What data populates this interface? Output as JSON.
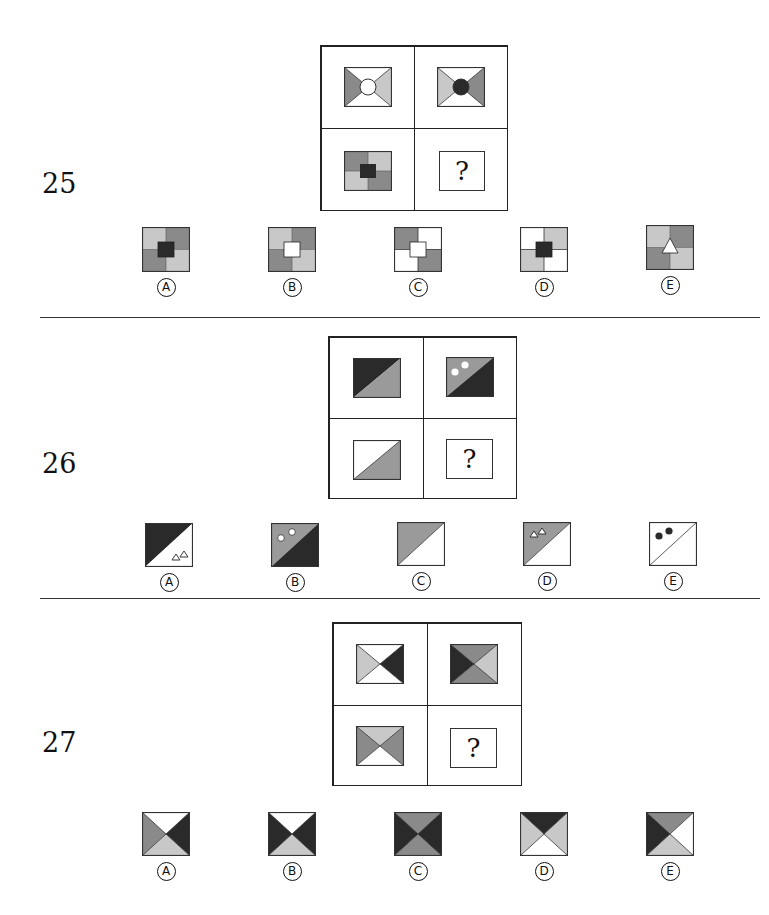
{
  "colors": {
    "black": "#2a2a2a",
    "dark_gray": "#8a8a8a",
    "light_gray": "#c8c8c8",
    "white": "#ffffff",
    "border": "#222222"
  },
  "questions": [
    {
      "number": "25",
      "missing_mark": "?",
      "grid_description": [
        "envelope with gray left/light right wedges and white center circle",
        "envelope with light left/gray right wedges and black center circle",
        "four-quadrant square (dark gray TL/BR, light gray TR/BL) with black center square",
        "?"
      ],
      "options": [
        {
          "label": "A",
          "description": "quadrants TL light, TR dark, BL dark, BR light, black center square"
        },
        {
          "label": "B",
          "description": "quadrants TL light, TR dark, BL dark, BR light, white center square"
        },
        {
          "label": "C",
          "description": "quadrants TL dark, TR white, BL white, BR dark, white center square"
        },
        {
          "label": "D",
          "description": "quadrants TL white, TR light, BL light, BR white, black center square"
        },
        {
          "label": "E",
          "description": "quadrants TL light, TR dark, BL dark, BR light, white center triangle"
        }
      ]
    },
    {
      "number": "26",
      "missing_mark": "?",
      "grid_description": [
        "rectangle split by diagonal: black upper-left, gray lower-right",
        "rectangle split by diagonal: gray upper-left with two white dots, black lower-right",
        "rectangle split by diagonal: white upper-left, gray lower-right",
        "?"
      ],
      "options": [
        {
          "label": "A",
          "description": "black upper-left, white lower-right with two outline triangles"
        },
        {
          "label": "B",
          "description": "gray upper-left with two white dots, black lower-right"
        },
        {
          "label": "C",
          "description": "gray upper-left, white lower-right"
        },
        {
          "label": "D",
          "description": "gray upper-left with two outline triangles, white lower-right"
        },
        {
          "label": "E",
          "description": "white upper-left with two black dots, white lower-right"
        }
      ]
    },
    {
      "number": "27",
      "missing_mark": "?",
      "grid_description": [
        "hourglass X: top white, left light, right black, bottom white",
        "hourglass X: top gray, left black, right light, bottom gray",
        "hourglass X: top light, left gray, right gray, bottom white",
        "?"
      ],
      "options": [
        {
          "label": "A",
          "description": "top white, left gray, right black, bottom light"
        },
        {
          "label": "B",
          "description": "top white, left black, right black, bottom light"
        },
        {
          "label": "C",
          "description": "top gray, left black, right black, bottom gray"
        },
        {
          "label": "D",
          "description": "top black, left light, right light, bottom white"
        },
        {
          "label": "E",
          "description": "top gray, left black, right white, bottom light"
        }
      ]
    }
  ]
}
